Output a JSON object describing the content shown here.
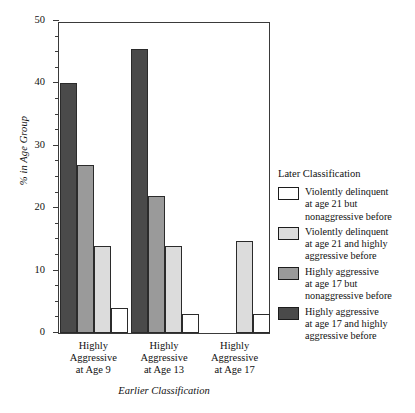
{
  "chart_data": {
    "type": "bar",
    "title": "",
    "xlabel": "Earlier Classification",
    "ylabel": "% in Age Group",
    "ylim": [
      0,
      50
    ],
    "ytick_labels": [
      "0",
      "10",
      "20",
      "30",
      "40",
      "50"
    ],
    "ytick_values": [
      0,
      10,
      20,
      30,
      40,
      50
    ],
    "yminor_step": 2.5,
    "grid": false,
    "legend_position": "right",
    "legend_title": "Later Classification",
    "categories": [
      "Highly Aggressive at Age 9",
      "Highly Aggressive at Age 13",
      "Highly Aggressive at Age 17"
    ],
    "category_lines": [
      [
        "Highly",
        "Aggressive",
        "at Age 9"
      ],
      [
        "Highly",
        "Aggressive",
        "at Age 13"
      ],
      [
        "Highly",
        "Aggressive",
        "at Age 17"
      ]
    ],
    "series": [
      {
        "name": "Highly aggressive at age 17 and highly aggressive before",
        "color": "#4a4a4a",
        "values": [
          40,
          45.5,
          0
        ]
      },
      {
        "name": "Highly aggressive at age 17 but nonaggressive before",
        "color": "#9a9a9a",
        "values": [
          27,
          22,
          0
        ]
      },
      {
        "name": "Violently delinquent at age 21 and highly aggressive before",
        "color": "#dcdcdc",
        "values": [
          14,
          14,
          14.8
        ]
      },
      {
        "name": "Violently delinquent at age 21 but nonaggressive before",
        "color": "#ffffff",
        "values": [
          4,
          3,
          3
        ]
      }
    ]
  },
  "legend": {
    "title": "Later Classification",
    "items": [
      {
        "color": "#ffffff",
        "lines": [
          "Violently delinquent",
          "at age 21 but",
          "nonaggressive before"
        ]
      },
      {
        "color": "#dcdcdc",
        "lines": [
          "Violently delinquent",
          "at age 21 and highly",
          "aggressive before"
        ]
      },
      {
        "color": "#9a9a9a",
        "lines": [
          "Highly aggressive",
          "at age 17 but",
          "nonaggressive before"
        ]
      },
      {
        "color": "#4a4a4a",
        "lines": [
          "Highly aggressive",
          "at age 17 and highly",
          "aggressive before"
        ]
      }
    ]
  }
}
